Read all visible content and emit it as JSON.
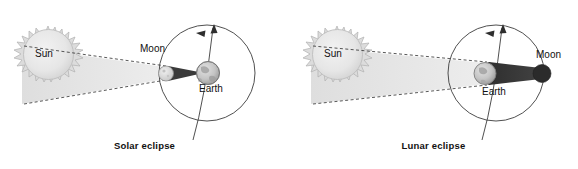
{
  "figure": {
    "background_color": "#ffffff",
    "panels": [
      {
        "id": "solar",
        "caption": "Solar eclipse",
        "labels": {
          "sun": "Sun",
          "moon": "Moon",
          "earth": "Earth"
        },
        "description": "The Moon passes between the Sun and Earth; the Moon's narrow shadow cone falls on Earth.",
        "shadow_caster": "Moon",
        "shadow_receiver": "Earth"
      },
      {
        "id": "lunar",
        "caption": "Lunar eclipse",
        "labels": {
          "sun": "Sun",
          "moon": "Moon",
          "earth": "Earth"
        },
        "description": "Earth passes between the Sun and the Moon; Earth's wide shadow cone falls on the Moon.",
        "shadow_caster": "Earth",
        "shadow_receiver": "Moon"
      }
    ]
  },
  "colors": {
    "sun_fill": "#e8e8e8",
    "sun_edge": "#b5b5b5",
    "beam_fill": "#e4e4e4",
    "shadow_dark": "#3a3a3a",
    "moon_light": "#dcdcdc",
    "earth_fill": "#c9c9c9",
    "line": "#3c3c3c",
    "text": "#111111"
  },
  "icons": {
    "axis_arrow": "axis-arrow-icon",
    "orbit_arrow": "orbit-direction-arrow-icon",
    "sun_body": "sun-icon",
    "moon_body": "moon-icon",
    "earth_body": "earth-globe-icon"
  }
}
